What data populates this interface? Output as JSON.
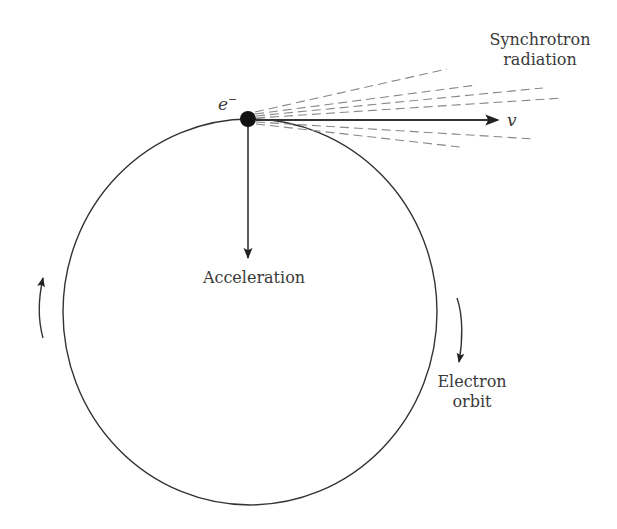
{
  "diagram": {
    "labels": {
      "particle": "e",
      "particle_charge": "−",
      "velocity": "v",
      "radiation_line1": "Synchrotron",
      "radiation_line2": "radiation",
      "acceleration": "Acceleration",
      "orbit_line1": "Electron",
      "orbit_line2": "orbit"
    },
    "geometry": {
      "orbit": {
        "cx": 250,
        "cy": 312,
        "rx": 187,
        "ry": 193
      },
      "electron": {
        "x": 248,
        "y": 119,
        "r": 8
      },
      "velocity_arrow_end": {
        "x": 498,
        "y": 120
      },
      "acceleration_arrow_end": {
        "x": 248,
        "y": 258
      },
      "radiation_rays": [
        {
          "x": 447,
          "y": 69
        },
        {
          "x": 477,
          "y": 85
        },
        {
          "x": 543,
          "y": 88
        },
        {
          "x": 563,
          "y": 98
        },
        {
          "x": 535,
          "y": 139
        },
        {
          "x": 460,
          "y": 147
        }
      ]
    },
    "colors": {
      "line": "#333333",
      "dashed": "#888888",
      "text": "#3a3a3a"
    }
  }
}
